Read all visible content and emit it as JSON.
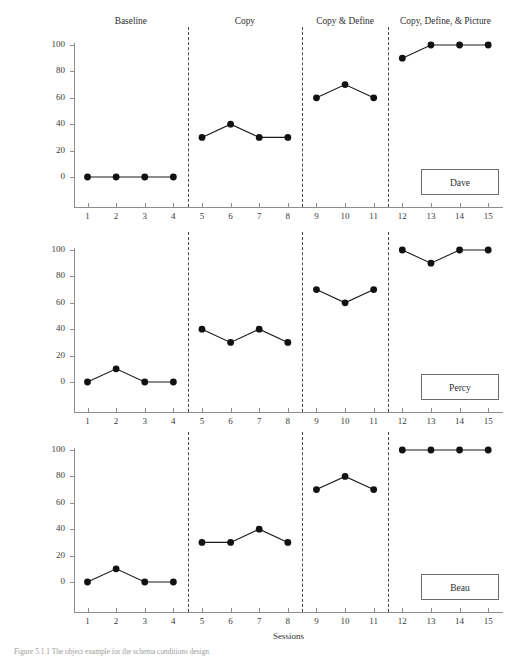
{
  "figure": {
    "ylabel": "Percentage of Vocabulary Words Defined  Correctly",
    "xlabel": "Sessions",
    "caption": "Figure 5.1.1  The object example for the schema conditions design."
  },
  "chart_data": {
    "type": "line",
    "title": "",
    "xlabel": "Sessions",
    "ylabel": "Percentage of Vocabulary Words Defined  Correctly",
    "xlim": [
      0,
      16
    ],
    "ylim": [
      0,
      100
    ],
    "yticks": [
      0,
      20,
      40,
      60,
      80,
      100
    ],
    "xticks": [
      1,
      2,
      3,
      4,
      5,
      6,
      7,
      8,
      9,
      10,
      11,
      12,
      13,
      14,
      15
    ],
    "grid": false,
    "legend_position": "inside-bottom-right",
    "marker": "filled-circle",
    "line_color": "#1a1a1a",
    "marker_color": "#111111",
    "phases": [
      {
        "label": "Baseline",
        "sessions": [
          1,
          2,
          3,
          4
        ]
      },
      {
        "label": "Copy",
        "sessions": [
          5,
          6,
          7,
          8
        ]
      },
      {
        "label": "Copy & Define",
        "sessions": [
          9,
          10,
          11
        ]
      },
      {
        "label": "Copy, Define, & Picture",
        "sessions": [
          12,
          13,
          14,
          15
        ]
      }
    ],
    "phase_boundaries_after_session": [
      4,
      8,
      11
    ],
    "panels": [
      {
        "name": "Dave",
        "segments": [
          {
            "phase": "Baseline",
            "x": [
              1,
              2,
              3,
              4
            ],
            "y": [
              0,
              0,
              0,
              0
            ]
          },
          {
            "phase": "Copy",
            "x": [
              5,
              6,
              7,
              8
            ],
            "y": [
              30,
              40,
              30,
              30
            ]
          },
          {
            "phase": "Copy & Define",
            "x": [
              9,
              10,
              11
            ],
            "y": [
              60,
              70,
              60
            ]
          },
          {
            "phase": "Copy, Define, & Picture",
            "x": [
              12,
              13,
              14,
              15
            ],
            "y": [
              90,
              100,
              100,
              100
            ]
          }
        ]
      },
      {
        "name": "Percy",
        "segments": [
          {
            "phase": "Baseline",
            "x": [
              1,
              2,
              3,
              4
            ],
            "y": [
              0,
              10,
              0,
              0
            ]
          },
          {
            "phase": "Copy",
            "x": [
              5,
              6,
              7,
              8
            ],
            "y": [
              40,
              30,
              40,
              30
            ]
          },
          {
            "phase": "Copy & Define",
            "x": [
              9,
              10,
              11
            ],
            "y": [
              70,
              60,
              70
            ]
          },
          {
            "phase": "Copy, Define, & Picture",
            "x": [
              12,
              13,
              14,
              15
            ],
            "y": [
              100,
              90,
              100,
              100
            ]
          }
        ]
      },
      {
        "name": "Beau",
        "segments": [
          {
            "phase": "Baseline",
            "x": [
              1,
              2,
              3,
              4
            ],
            "y": [
              0,
              10,
              0,
              0
            ]
          },
          {
            "phase": "Copy",
            "x": [
              5,
              6,
              7,
              8
            ],
            "y": [
              30,
              30,
              40,
              30
            ]
          },
          {
            "phase": "Copy & Define",
            "x": [
              9,
              10,
              11
            ],
            "y": [
              70,
              80,
              70
            ]
          },
          {
            "phase": "Copy, Define, & Picture",
            "x": [
              12,
              13,
              14,
              15
            ],
            "y": [
              100,
              100,
              100,
              100
            ]
          }
        ]
      }
    ]
  }
}
